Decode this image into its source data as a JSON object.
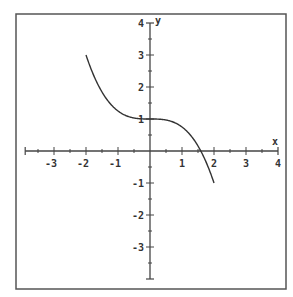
{
  "chart_data": {
    "type": "line",
    "title": "",
    "xlabel": "x",
    "ylabel": "y",
    "xlim": [
      -4,
      4
    ],
    "ylim": [
      -4,
      4
    ],
    "grid": false,
    "legend": null,
    "x_ticks": [
      -3,
      -2,
      -1,
      1,
      2,
      3,
      4
    ],
    "y_ticks": [
      4,
      3,
      2,
      1,
      -1,
      -2,
      -3
    ],
    "minor_tick_step": 0.5,
    "function": "y = 1 - x^3/4",
    "domain": [
      -2,
      2
    ],
    "series": [
      {
        "name": "f(x)",
        "x": [
          -2.0,
          -1.75,
          -1.5,
          -1.25,
          -1.0,
          -0.75,
          -0.5,
          -0.25,
          0.0,
          0.25,
          0.5,
          0.75,
          1.0,
          1.25,
          1.5,
          1.75,
          2.0
        ],
        "y": [
          3.0,
          2.34,
          1.84,
          1.49,
          1.25,
          1.11,
          1.03,
          1.0,
          1.0,
          1.0,
          0.97,
          0.89,
          0.75,
          0.51,
          0.16,
          -0.34,
          -1.0
        ]
      }
    ]
  },
  "colors": {
    "frame": "#555555",
    "axis": "#444444",
    "curve": "#333333",
    "background": "#ffffff"
  }
}
